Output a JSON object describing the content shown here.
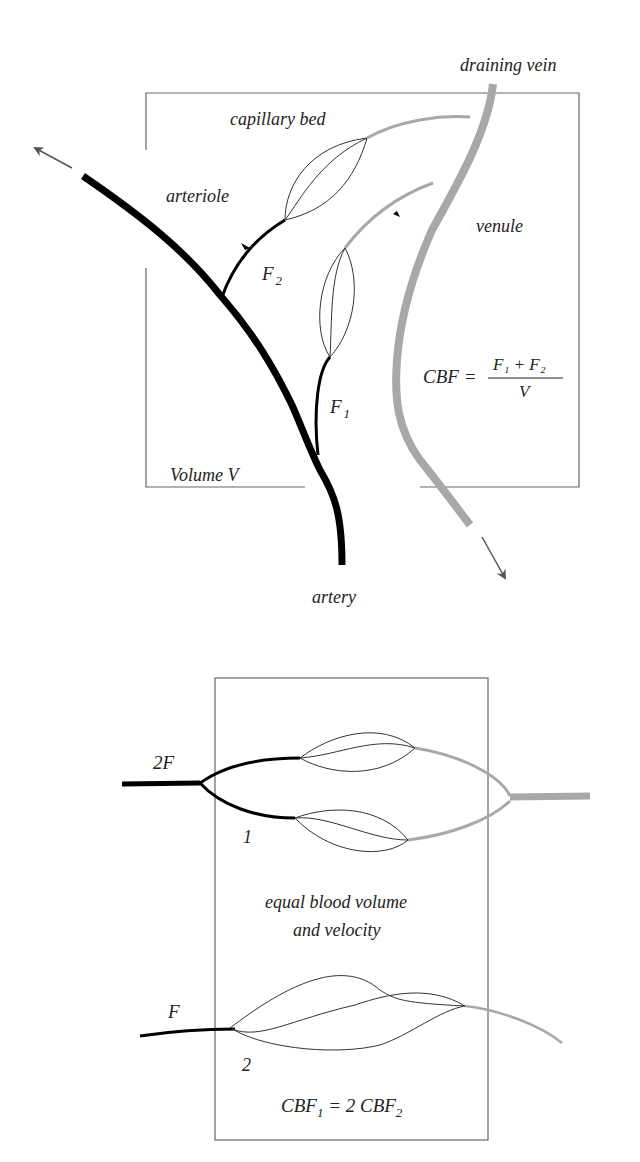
{
  "top_diagram": {
    "labels": {
      "draining_vein": "draining vein",
      "capillary_bed": "capillary bed",
      "arteriole": "arteriole",
      "venule": "venule",
      "f2": "F",
      "f2_sub": "2",
      "f1": "F",
      "f1_sub": "1",
      "volume": "Volume V",
      "artery": "artery"
    },
    "equation": {
      "lhs": "CBF =",
      "numerator": "F₁ + F₂",
      "denominator": "V"
    },
    "colors": {
      "artery": "#000000",
      "vein": "#a8a8a8",
      "box": "#555555"
    }
  },
  "bottom_diagram": {
    "labels": {
      "two_f": "2F",
      "one": "1",
      "note_line1": "equal blood volume",
      "note_line2": "and velocity",
      "f": "F",
      "two": "2"
    },
    "equation": {
      "part1": "CBF",
      "sub1": "1",
      "middle": " = 2 CBF",
      "sub2": "2"
    }
  }
}
